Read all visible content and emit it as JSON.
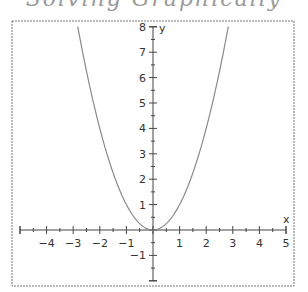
{
  "page": {
    "top_fragment": "Solving Graphically"
  },
  "chart_data": {
    "type": "line",
    "title": "",
    "function": "y = x^2",
    "xlabel": "x",
    "ylabel": "y",
    "xlim": [
      -5,
      5
    ],
    "ylim": [
      -2,
      8
    ],
    "grid": false,
    "legend": "none",
    "x_ticks": [
      -4,
      -3,
      -2,
      -1,
      1,
      2,
      3,
      4,
      5
    ],
    "x_minor_step": 0.5,
    "y_ticks": [
      -1,
      1,
      2,
      3,
      4,
      5,
      6,
      7,
      8
    ],
    "y_minor_step": 0.5,
    "series": [
      {
        "name": "y = x^2",
        "x": [
          -2.83,
          -2.5,
          -2,
          -1.5,
          -1,
          -0.5,
          0,
          0.5,
          1,
          1.5,
          2,
          2.5,
          2.83
        ],
        "y": [
          8,
          6.25,
          4,
          2.25,
          1,
          0.25,
          0,
          0.25,
          1,
          2.25,
          4,
          6.25,
          8
        ]
      }
    ],
    "colors": {
      "curve": "#8a8a8a",
      "axes": "#444444",
      "frame": "#777777"
    }
  }
}
